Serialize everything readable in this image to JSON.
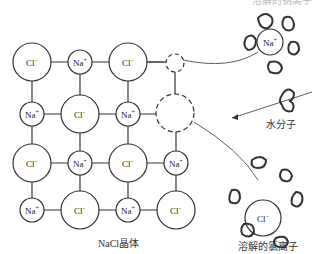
{
  "diagram": {
    "type": "NaCl dissolution in water",
    "lattice_caption": "NaCl晶体",
    "water_label": "水分子",
    "chloride_label": "溶解的氯离子",
    "sodium_label_partial": "溶解的钠离子",
    "lattice": [
      [
        "Cl⁻",
        "Na⁺",
        "Cl⁻"
      ],
      [
        "Na⁺",
        "Cl⁻",
        "Na⁺"
      ],
      [
        "Cl⁻",
        "Na⁺",
        "Cl⁻",
        "Na⁺"
      ],
      [
        "Na⁺",
        "Cl⁻",
        "Na⁺",
        "Cl⁻"
      ]
    ],
    "hydrated_cation": "Na⁺",
    "hydrated_anion": "Cl⁻",
    "colors": {
      "stroke": "#333333",
      "background": "#ffffff"
    }
  }
}
